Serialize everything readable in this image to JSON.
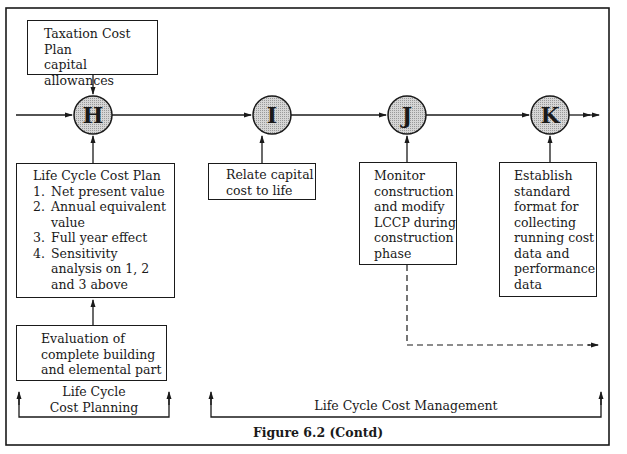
{
  "figure": {
    "caption": "Figure 6.2 (Contd)"
  },
  "nodes": [
    {
      "id": "H",
      "label": "H"
    },
    {
      "id": "I",
      "label": "I"
    },
    {
      "id": "J",
      "label": "J"
    },
    {
      "id": "K",
      "label": "K"
    }
  ],
  "boxes": {
    "taxation": {
      "lines": [
        "Taxation Cost",
        "Plan",
        "capital allowances"
      ]
    },
    "lccp": {
      "title": "Life Cycle Cost Plan",
      "items": [
        {
          "num": "1.",
          "text": "Net present value"
        },
        {
          "num": "2.",
          "text": "Annual equivalent value"
        },
        {
          "num": "3.",
          "text": "Full year effect"
        },
        {
          "num": "4.",
          "text": "Sensitivity analysis on 1, 2 and 3 above"
        }
      ]
    },
    "evaluation": {
      "lines": [
        "Evaluation of",
        "complete building",
        "and elemental part"
      ]
    },
    "relate": {
      "lines": [
        "Relate capital",
        "cost to life",
        "cycle plan"
      ]
    },
    "monitor": {
      "lines": [
        "Monitor",
        "construction",
        "and modify",
        "LCCP during",
        "construction",
        "phase"
      ]
    },
    "establish": {
      "lines": [
        "Establish",
        "standard",
        "format for",
        "collecting",
        "running cost",
        "data and",
        "performance",
        "data"
      ]
    }
  },
  "brackets": {
    "planning": {
      "line1": "Life Cycle",
      "line2": "Cost Planning"
    },
    "management": {
      "label": "Life Cycle Cost Management"
    }
  },
  "colors": {
    "stroke": "#1a1a1a",
    "node_fill": "#cfcfcf"
  }
}
